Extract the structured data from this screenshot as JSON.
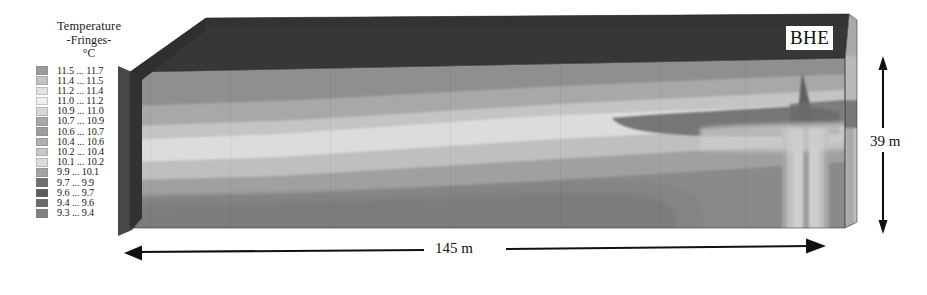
{
  "figure": {
    "kind": "3d-temperature-fringe-block",
    "background": "#ffffff"
  },
  "legend": {
    "title": "Temperature",
    "subtitle": "-Fringes-",
    "unit": "°C",
    "entries": [
      {
        "label": "11.5 ... 11.7",
        "color": "#9b9b9b",
        "from": 11.5,
        "to": 11.7
      },
      {
        "label": "11.4 ... 11.5",
        "color": "#c3c3c3",
        "from": 11.4,
        "to": 11.5
      },
      {
        "label": "11.2 ... 11.4",
        "color": "#e2e2e2",
        "from": 11.2,
        "to": 11.4
      },
      {
        "label": "11.0 ... 11.2",
        "color": "#efefef",
        "from": 11.0,
        "to": 11.2
      },
      {
        "label": "10.9 ... 11.0",
        "color": "#d8d8d8",
        "from": 10.9,
        "to": 11.0
      },
      {
        "label": "10.7 ... 10.9",
        "color": "#a8a8a8",
        "from": 10.7,
        "to": 10.9
      },
      {
        "label": "10.6 ... 10.7",
        "color": "#9d9d9d",
        "from": 10.6,
        "to": 10.7
      },
      {
        "label": "10.4 ... 10.6",
        "color": "#b0b0b0",
        "from": 10.4,
        "to": 10.6
      },
      {
        "label": "10.2 ... 10.4",
        "color": "#c8c8c8",
        "from": 10.2,
        "to": 10.4
      },
      {
        "label": "10.1 ... 10.2",
        "color": "#dcdcdc",
        "from": 10.1,
        "to": 10.2
      },
      {
        "label": "9.9 ... 10.1",
        "color": "#a3a3a3",
        "from": 9.9,
        "to": 10.1
      },
      {
        "label": "9.7 ... 9.9",
        "color": "#707070",
        "from": 9.7,
        "to": 9.9
      },
      {
        "label": "9.6 ... 9.7",
        "color": "#5c5c5c",
        "from": 9.6,
        "to": 9.7
      },
      {
        "label": "9.4 ... 9.6",
        "color": "#6a6a6a",
        "from": 9.4,
        "to": 9.6
      },
      {
        "label": "9.3 ... 9.4",
        "color": "#828282",
        "from": 9.3,
        "to": 9.4
      }
    ]
  },
  "annotations": {
    "bhe_label": "BHE",
    "height_label": "39 m",
    "width_label": "145 m"
  },
  "chart_data": {
    "type": "heatmap",
    "title": "Temperature",
    "subtitle": "-Fringes-",
    "unit": "°C",
    "domain": {
      "width_m": 145,
      "height_m": 39,
      "width_label": "145 m",
      "height_label": "39 m"
    },
    "feature": {
      "name": "BHE",
      "description": "Borehole heat exchanger at right end of model domain",
      "position": "right",
      "plume": "cold vertical plume descending from BHE"
    },
    "value_range": [
      9.3,
      11.7
    ],
    "band_edges": [
      9.3,
      9.4,
      9.6,
      9.7,
      9.9,
      10.1,
      10.2,
      10.4,
      10.6,
      10.7,
      10.9,
      11.0,
      11.2,
      11.4,
      11.5,
      11.7
    ],
    "legend_position": "left",
    "grid": false,
    "faces": {
      "top": {
        "fill": "#3a3a3a",
        "note": "dark ground surface / top face of block"
      },
      "front": {
        "note": "stratified horizontal temperature bands sloping slightly upward to the right"
      },
      "right": {
        "note": "side face showing vertical plume cross-section"
      }
    },
    "front_bands": [
      {
        "color": "#8e8e8e",
        "y_top_frac": 0.0,
        "y_bot_frac": 0.2,
        "band": "11.0 ... 11.2"
      },
      {
        "color": "#b5b5b5",
        "y_top_frac": 0.2,
        "y_bot_frac": 0.33,
        "band": "11.2 ... 11.4"
      },
      {
        "color": "#d6d6d6",
        "y_top_frac": 0.33,
        "y_bot_frac": 0.47,
        "band": "11.4 ... 11.5"
      },
      {
        "color": "#bdbdbd",
        "y_top_frac": 0.47,
        "y_bot_frac": 0.6,
        "band": "10.9 ... 11.0"
      },
      {
        "color": "#9a9a9a",
        "y_top_frac": 0.6,
        "y_bot_frac": 0.72,
        "band": "10.6 ... 10.7"
      },
      {
        "color": "#808080",
        "y_top_frac": 0.72,
        "y_bot_frac": 1.0,
        "band": "10.1 ... 10.2"
      }
    ]
  }
}
